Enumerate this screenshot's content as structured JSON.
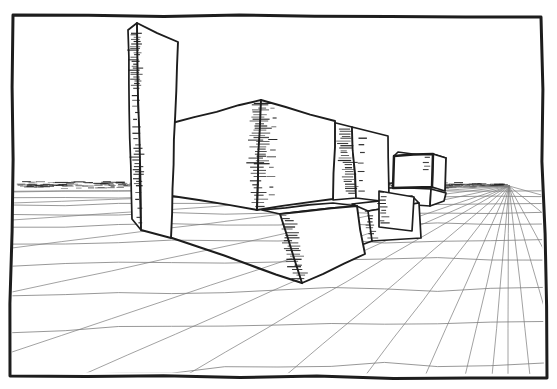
{
  "meta": {
    "canvas": {
      "w": 557,
      "h": 389
    }
  },
  "style": {
    "paper": "#ffffff",
    "ink": "#1d1d1d",
    "grid_color": "#7e7e7e",
    "frame_stroke": 3.0,
    "box_stroke": 1.7,
    "grid_stroke": 0.8,
    "monitor_stroke": 2.5
  },
  "frame": {
    "corners": [
      [
        13,
        15
      ],
      [
        541,
        17
      ],
      [
        547,
        378
      ],
      [
        10,
        376
      ]
    ],
    "clip": [
      [
        14,
        18
      ],
      [
        539,
        20
      ],
      [
        544,
        374
      ],
      [
        12,
        372
      ]
    ]
  },
  "vanishing_point": [
    509,
    186
  ],
  "horizon_band": {
    "x0": 16,
    "x1": 509,
    "y": 185,
    "half_h": 3.4,
    "taper_from": 430,
    "count": 320,
    "core_count": 90,
    "min_len": 4,
    "max_len": 14
  },
  "grid": {
    "radial_targets": [
      [
        12,
        192
      ],
      [
        12,
        203
      ],
      [
        12,
        220
      ],
      [
        12,
        248
      ],
      [
        12,
        292
      ],
      [
        12,
        352
      ],
      [
        80,
        376
      ],
      [
        185,
        376
      ],
      [
        285,
        376
      ],
      [
        365,
        376
      ],
      [
        425,
        376
      ],
      [
        465,
        376
      ],
      [
        492,
        376
      ],
      [
        508,
        376
      ],
      [
        530,
        376
      ],
      [
        545,
        310
      ],
      [
        545,
        252
      ],
      [
        545,
        215
      ],
      [
        545,
        196
      ]
    ],
    "transversal_y": [
      191,
      197,
      204,
      213,
      225,
      241,
      262,
      290,
      325,
      367
    ],
    "x_min": 12,
    "x_max": 544
  },
  "boxes": [
    {
      "name": "monitor-stand",
      "faces": [
        {
          "pts": [
            [
              386,
              188
            ],
            [
              431,
              189
            ],
            [
              430,
              206
            ],
            [
              386,
              204
            ]
          ]
        },
        {
          "pts": [
            [
              431,
              189
            ],
            [
              446,
              193
            ],
            [
              444,
              201
            ],
            [
              430,
              206
            ]
          ]
        }
      ]
    },
    {
      "name": "monitor-box",
      "faces": [
        {
          "pts": [
            [
              394,
              156
            ],
            [
              398,
              152
            ],
            [
              446,
              158
            ],
            [
              433,
              154
            ]
          ],
          "sw": 1.6
        },
        {
          "pts": [
            [
              433,
              154
            ],
            [
              446,
              158
            ],
            [
              445,
              191
            ],
            [
              432,
              187
            ]
          ],
          "sw": 1.8
        },
        {
          "pts": [
            [
              394,
              156
            ],
            [
              433,
              154
            ],
            [
              432,
              187
            ],
            [
              393,
              188
            ]
          ],
          "sw": 2.5
        }
      ],
      "hatch": [
        {
          "x0": 427,
          "y0": 157,
          "x1": 427,
          "y1": 171,
          "w": 5,
          "step": 4.5
        }
      ]
    },
    {
      "name": "medium-box",
      "faces": [
        {
          "pts": [
            [
              332,
              122
            ],
            [
              352,
              127
            ],
            [
              356,
              198
            ],
            [
              333,
              200
            ]
          ]
        },
        {
          "pts": [
            [
              352,
              127
            ],
            [
              388,
              136
            ],
            [
              389,
              202
            ],
            [
              356,
              198
            ]
          ]
        }
      ],
      "hatch": [
        {
          "x0": 344,
          "y0": 129,
          "x1": 351,
          "y1": 196,
          "w": 11,
          "step": 2.4
        },
        {
          "x0": 361,
          "y0": 136,
          "x1": 363,
          "y1": 193,
          "w": 6,
          "step": 9
        }
      ]
    },
    {
      "name": "rear-slab",
      "faces": [
        {
          "pts": [
            [
              352,
              204
            ],
            [
              412,
              196
            ],
            [
              419,
              203
            ],
            [
              368,
              211
            ]
          ]
        },
        {
          "pts": [
            [
              368,
              211
            ],
            [
              419,
              203
            ],
            [
              421,
              238
            ],
            [
              372,
              241
            ]
          ]
        }
      ],
      "lines": [
        {
          "pts": [
            [
              356,
              247
            ],
            [
              372,
              241
            ]
          ],
          "sw": 1.8
        }
      ],
      "hatch": [
        {
          "x0": 369,
          "y0": 212,
          "x1": 372,
          "y1": 239,
          "w": 8,
          "step": 3.2
        }
      ]
    },
    {
      "name": "side-slab",
      "faces": [
        {
          "pts": [
            [
              379,
              191
            ],
            [
              414,
              197
            ],
            [
              412,
              231
            ],
            [
              379,
              227
            ]
          ]
        }
      ],
      "hatch": [
        {
          "x0": 383,
          "y0": 193,
          "x1": 384,
          "y1": 226,
          "w": 7,
          "step": 3.4
        }
      ]
    },
    {
      "name": "cube-box",
      "faces": [
        {
          "pts": [
            [
              172,
              123
            ],
            [
              261,
              100
            ],
            [
              257,
              210
            ],
            [
              172,
              196
            ]
          ],
          "sw": 1.9
        },
        {
          "pts": [
            [
              261,
              100
            ],
            [
              335,
              121
            ],
            [
              333,
              199
            ],
            [
              257,
              210
            ]
          ],
          "sw": 1.9
        }
      ],
      "hatch": [
        {
          "x0": 260,
          "y0": 103,
          "x1": 259,
          "y1": 163,
          "w": 14,
          "step": 2.3
        },
        {
          "x0": 259,
          "y0": 163,
          "x1": 258,
          "y1": 209,
          "w": 12,
          "step": 3.6
        },
        {
          "x0": 274,
          "y0": 110,
          "x1": 272,
          "y1": 200,
          "w": 7,
          "step": 9.5
        }
      ]
    },
    {
      "name": "front-slab",
      "faces": [
        {
          "pts": [
            [
              262,
              210
            ],
            [
              333,
              203
            ],
            [
              357,
              206
            ],
            [
              280,
              214
            ]
          ]
        },
        {
          "pts": [
            [
              280,
              214
            ],
            [
              357,
              206
            ],
            [
              365,
              254
            ],
            [
              302,
              283
            ]
          ],
          "sw": 1.9
        }
      ],
      "lines": [
        {
          "pts": [
            [
              172,
              238
            ],
            [
              302,
              283
            ]
          ],
          "sw": 2.2
        }
      ],
      "hatch": [
        {
          "x0": 286,
          "y0": 216,
          "x1": 299,
          "y1": 280,
          "w": 12,
          "step": 2.7
        }
      ]
    },
    {
      "name": "tower-box",
      "faces": [
        {
          "pts": [
            [
              128,
              30
            ],
            [
              137,
              23
            ],
            [
              141,
              230
            ],
            [
              132,
              219
            ]
          ]
        },
        {
          "pts": [
            [
              137,
              23
            ],
            [
              178,
              42
            ],
            [
              171,
              238
            ],
            [
              141,
              230
            ]
          ],
          "sw": 1.9
        }
      ],
      "hatch": [
        {
          "x0": 135,
          "y0": 33,
          "x1": 136,
          "y1": 88,
          "w": 9,
          "step": 2.2
        },
        {
          "x0": 136,
          "y0": 88,
          "x1": 137,
          "y1": 148,
          "w": 6,
          "step": 6.5
        },
        {
          "x0": 137,
          "y0": 148,
          "x1": 138,
          "y1": 184,
          "w": 8,
          "step": 3
        },
        {
          "x0": 138,
          "y0": 184,
          "x1": 139,
          "y1": 226,
          "w": 5,
          "step": 8
        }
      ]
    }
  ]
}
